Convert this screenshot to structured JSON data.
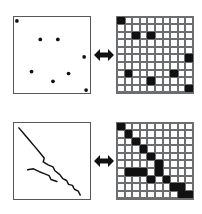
{
  "figure": {
    "title": "",
    "rows": [
      {
        "name": "point-pattern-row",
        "left_panel": {
          "kind": "scatter-plot",
          "label": "",
          "points": [
            {
              "x": 3,
              "y": 4
            },
            {
              "x": 27,
              "y": 23
            },
            {
              "x": 45,
              "y": 23
            },
            {
              "x": 72,
              "y": 41
            },
            {
              "x": 18,
              "y": 56
            },
            {
              "x": 56,
              "y": 58
            },
            {
              "x": 40,
              "y": 66
            },
            {
              "x": 74,
              "y": 75
            }
          ],
          "point_count": 8,
          "point_color": "#111111"
        },
        "arrow": {
          "name": "double-headed-arrow",
          "glyph": "left-right-arrow"
        },
        "right_panel": {
          "kind": "binary-grid",
          "label": "",
          "rows": 10,
          "cols": 10,
          "fill_color": "#111111",
          "empty_color": "#fdfdfd",
          "grid_line_color": "#6d6e70",
          "filled_cells": [
            [
              0,
              0
            ],
            [
              2,
              2
            ],
            [
              2,
              4
            ],
            [
              5,
              9
            ],
            [
              7,
              1
            ],
            [
              7,
              7
            ],
            [
              8,
              4
            ],
            [
              9,
              9
            ]
          ],
          "filled_count": 8
        }
      },
      {
        "name": "line-pattern-row",
        "left_panel": {
          "kind": "polyline-plot",
          "label": "",
          "polylines": [
            {
              "name": "long-diagonal-line",
              "points": "5,5 11,12 16,18 22,25 27,31 31,36 30,40 35,43 40,45 42,49 47,53 50,57 54,59 56,63 60,64 62,68 66,70 68,74"
            },
            {
              "name": "short-lower-line",
              "points": "14,48 20,47 26,50 31,52 36,54 38,58 44,60"
            }
          ],
          "line_color": "#111111"
        },
        "arrow": {
          "name": "double-headed-arrow",
          "glyph": "left-right-arrow"
        },
        "right_panel": {
          "kind": "binary-grid",
          "label": "",
          "rows": 10,
          "cols": 10,
          "fill_color": "#111111",
          "empty_color": "#fdfdfd",
          "grid_line_color": "#6d6e70",
          "filled_cells": [
            [
              0,
              0
            ],
            [
              1,
              1
            ],
            [
              2,
              2
            ],
            [
              3,
              3
            ],
            [
              4,
              4
            ],
            [
              5,
              5
            ],
            [
              6,
              1
            ],
            [
              6,
              2
            ],
            [
              6,
              3
            ],
            [
              6,
              5
            ],
            [
              7,
              4
            ],
            [
              7,
              6
            ],
            [
              8,
              7
            ],
            [
              8,
              8
            ],
            [
              9,
              8
            ],
            [
              9,
              9
            ]
          ],
          "filled_count": 16
        }
      }
    ]
  }
}
